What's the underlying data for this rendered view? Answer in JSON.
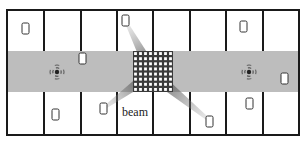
{
  "diagram": {
    "type": "floor-plan",
    "frame": {
      "x": 7,
      "y": 10,
      "width": 292,
      "height": 125
    },
    "corridor": {
      "y": 51,
      "height": 41,
      "color": "#bdbdbd"
    },
    "walls_x": [
      44,
      81,
      117,
      153,
      190,
      226,
      263
    ],
    "wall_color": "#1a1a1a",
    "access_points": [
      {
        "name": "access-point-left",
        "x": 57,
        "y": 72
      },
      {
        "name": "access-point-right",
        "x": 249,
        "y": 72
      }
    ],
    "ris_panel": {
      "x": 133,
      "y": 51,
      "width": 40,
      "height": 41,
      "rows": 8,
      "cols": 8
    },
    "devices": [
      {
        "x": 22,
        "y": 23
      },
      {
        "x": 122,
        "y": 15
      },
      {
        "x": 240,
        "y": 21
      },
      {
        "x": 79,
        "y": 53
      },
      {
        "x": 281,
        "y": 73
      },
      {
        "x": 52,
        "y": 109
      },
      {
        "x": 100,
        "y": 103
      },
      {
        "x": 206,
        "y": 116
      },
      {
        "x": 246,
        "y": 98
      }
    ],
    "beams": [
      {
        "from": [
          127,
          24
        ],
        "to": [
          150,
          68
        ]
      },
      {
        "from": [
          104,
          108
        ],
        "to": [
          148,
          76
        ]
      },
      {
        "from": [
          209,
          120
        ],
        "to": [
          155,
          76
        ]
      }
    ],
    "beam_label": {
      "text": "beam",
      "x": 122,
      "y": 116
    }
  }
}
